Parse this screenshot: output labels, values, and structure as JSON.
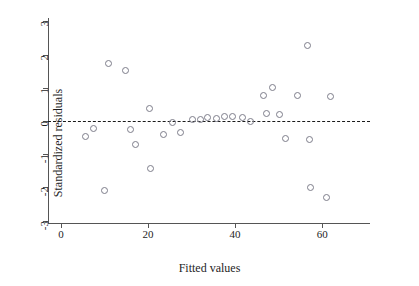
{
  "chart_data": {
    "type": "scatter",
    "title": "",
    "xlabel": "Fitted values",
    "ylabel": "Standardized residuals",
    "xlim": [
      -3,
      71
    ],
    "ylim": [
      -3.1,
      3.1
    ],
    "xticks": [
      0,
      20,
      40,
      60
    ],
    "yticks": [
      3,
      2,
      1,
      0,
      -1,
      -2,
      -3
    ],
    "xtick_labels": [
      "0",
      "20",
      "40",
      "60"
    ],
    "ytick_labels": [
      "3",
      "2",
      "1",
      "0",
      "-1",
      "-2",
      "-3"
    ],
    "grid": false,
    "legend": null,
    "annotations": [
      {
        "name": "zero-reference-line",
        "type": "hline",
        "y": 0,
        "style": "dashed",
        "color": "#1a1a1a"
      }
    ],
    "marker": {
      "shape": "open-circle",
      "edge_color": "#7d7d8a",
      "fill": "none",
      "size": 5
    },
    "points": [
      {
        "x": 5.4,
        "y": -0.46
      },
      {
        "x": 7.3,
        "y": -0.21
      },
      {
        "x": 9.9,
        "y": -2.08
      },
      {
        "x": 10.8,
        "y": 1.75
      },
      {
        "x": 14.7,
        "y": 1.55
      },
      {
        "x": 15.9,
        "y": -0.24
      },
      {
        "x": 17.0,
        "y": -0.68
      },
      {
        "x": 20.2,
        "y": 0.4
      },
      {
        "x": 20.4,
        "y": -1.42
      },
      {
        "x": 23.4,
        "y": -0.4
      },
      {
        "x": 25.6,
        "y": -0.02
      },
      {
        "x": 27.3,
        "y": -0.33
      },
      {
        "x": 30.1,
        "y": 0.06
      },
      {
        "x": 31.9,
        "y": 0.07
      },
      {
        "x": 33.5,
        "y": 0.11
      },
      {
        "x": 35.6,
        "y": 0.08
      },
      {
        "x": 37.4,
        "y": 0.15
      },
      {
        "x": 39.4,
        "y": 0.15
      },
      {
        "x": 41.5,
        "y": 0.13
      },
      {
        "x": 43.5,
        "y": 0.01
      },
      {
        "x": 46.3,
        "y": 0.77
      },
      {
        "x": 47.0,
        "y": 0.24
      },
      {
        "x": 48.4,
        "y": 1.02
      },
      {
        "x": 50.2,
        "y": 0.21
      },
      {
        "x": 51.5,
        "y": -0.52
      },
      {
        "x": 54.2,
        "y": 0.77
      },
      {
        "x": 56.5,
        "y": 2.29
      },
      {
        "x": 57.0,
        "y": -0.54
      },
      {
        "x": 57.3,
        "y": -1.98
      },
      {
        "x": 61.0,
        "y": -2.29
      },
      {
        "x": 61.9,
        "y": 0.74
      }
    ]
  },
  "figure": {
    "background_color": "#ffffff",
    "axis_color": "#555555",
    "text_color": "#1e1e1e"
  }
}
